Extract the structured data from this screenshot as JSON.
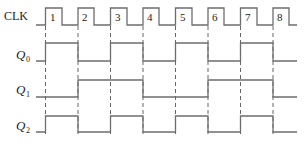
{
  "diagram": {
    "type": "timing-diagram",
    "signals": [
      {
        "name": "CLK",
        "label_main": "CLK",
        "label_sub": ""
      },
      {
        "name": "Q0",
        "label_main": "Q",
        "label_sub": "0"
      },
      {
        "name": "Q1",
        "label_main": "Q",
        "label_sub": "1"
      },
      {
        "name": "Q2",
        "label_main": "Q",
        "label_sub": "2"
      }
    ],
    "clock_pulses": [
      "1",
      "2",
      "3",
      "4",
      "5",
      "6",
      "7",
      "8"
    ],
    "states_after_each_edge": {
      "Q0": [
        1,
        0,
        1,
        0,
        1,
        0,
        1,
        0
      ],
      "Q1": [
        0,
        1,
        1,
        0,
        0,
        1,
        1,
        0
      ],
      "Q2": [
        1,
        0,
        1,
        0,
        1,
        0,
        1,
        0
      ]
    },
    "initial_states": {
      "Q0": 0,
      "Q1": 0,
      "Q2": 0
    },
    "colors": {
      "waveform": "#6d6d6d",
      "text": "#222222",
      "background": "#ffffff"
    }
  }
}
